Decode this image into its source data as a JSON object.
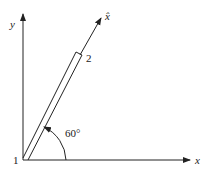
{
  "diagram": {
    "axes": {
      "x_label": "x",
      "y_label": "y",
      "rotated_axis_label": "x̂"
    },
    "rod": {
      "end_bottom_label": "1",
      "end_top_label": "2"
    },
    "angle": {
      "label": "60°",
      "value_deg": 60
    },
    "colors": {
      "line": "#222222",
      "background": "#ffffff"
    }
  }
}
